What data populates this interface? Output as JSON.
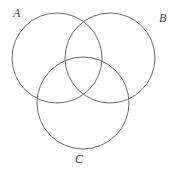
{
  "figure": {
    "kind": "venn-diagram",
    "width": 173,
    "height": 171,
    "background_color": "#ffffff",
    "stroke_color": "#6b6b6b",
    "stroke_width": 1,
    "label_color": "#3a3a3a"
  },
  "sets": [
    {
      "id": "A",
      "label": "A",
      "label_position": "top-left",
      "circle": {
        "cx": 57,
        "cy": 58,
        "r": 45
      }
    },
    {
      "id": "B",
      "label": "B",
      "label_position": "top-right",
      "circle": {
        "cx": 110,
        "cy": 58,
        "r": 45
      }
    },
    {
      "id": "C",
      "label": "C",
      "label_position": "bottom-center",
      "circle": {
        "cx": 83,
        "cy": 103,
        "r": 46
      }
    }
  ],
  "chart_data": {
    "type": "venn",
    "title": "",
    "set_labels": [
      "A",
      "B",
      "C"
    ],
    "set_count": 3,
    "regions": [
      "A only",
      "B only",
      "C only",
      "A∩B only",
      "A∩C only",
      "B∩C only",
      "A∩B∩C"
    ],
    "region_values": [],
    "labels_shown": true,
    "values_shown": false,
    "shaded_regions": [],
    "circles": [
      {
        "set": "A",
        "cx": 57,
        "cy": 58,
        "r": 45
      },
      {
        "set": "B",
        "cx": 110,
        "cy": 58,
        "r": 45
      },
      {
        "set": "C",
        "cx": 83,
        "cy": 103,
        "r": 46
      }
    ],
    "xlim": [
      0,
      173
    ],
    "ylim": [
      0,
      171
    ],
    "grid": false,
    "legend": "none"
  }
}
